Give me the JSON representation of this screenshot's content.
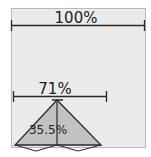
{
  "diagram": {
    "top_dimension": {
      "label": "100%"
    },
    "middle_dimension": {
      "label": "71%"
    },
    "triangle": {
      "label": "35.5%"
    },
    "colors": {
      "panel_fill": "#ebebeb",
      "panel_border": "#b8b8b8",
      "triangle_fill": "#c2c2c2",
      "line": "#2a2a2a"
    }
  }
}
